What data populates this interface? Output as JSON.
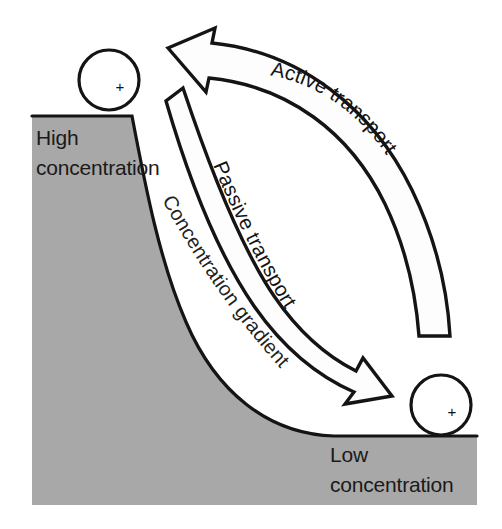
{
  "figure": {
    "name": "membrane-transport-concentration-gradient-diagram",
    "background_color": "#ffffff",
    "gradient_fill_color": "#a8a8a8",
    "stroke_color": "#111111",
    "arrow_fill_color": "#fdfdfd"
  },
  "labels": {
    "high_concentration_line1": "High",
    "high_concentration_line2": "concentration",
    "low_concentration_line1": "Low",
    "low_concentration_line2": "concentration",
    "active_transport": "Active transport",
    "passive_transport": "Passive transport",
    "concentration_gradient": "Concentration gradient"
  },
  "particles": [
    {
      "name": "particle-high-concentration",
      "charge": "+",
      "cx": 109,
      "cy": 80,
      "r": 30,
      "position_label": "top of gradient"
    },
    {
      "name": "particle-low-concentration",
      "charge": "+",
      "cx": 441,
      "cy": 405,
      "r": 30,
      "position_label": "bottom of gradient"
    }
  ],
  "arrows": [
    {
      "name": "active-transport-arrow",
      "label": "Active transport",
      "direction": "up-left",
      "from": "low concentration",
      "to": "high concentration",
      "style": "outlined block arrow"
    },
    {
      "name": "passive-transport-arrow",
      "label": "Passive transport",
      "direction": "down-right",
      "from": "high concentration",
      "to": "low concentration",
      "style": "outlined block arrow"
    }
  ],
  "gradient": {
    "name": "concentration-gradient-slope",
    "label": "Concentration gradient",
    "description": "Shaded slope descending from high concentration (upper left) to low concentration (lower right)"
  }
}
